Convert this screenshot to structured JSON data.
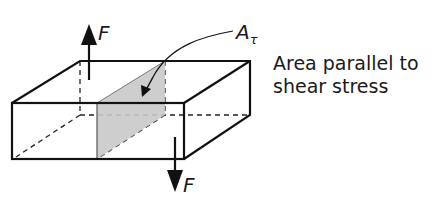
{
  "diagram": {
    "labels": {
      "force_top": "F",
      "force_bottom": "F",
      "area_symbol": "A",
      "area_subscript": "τ",
      "caption_line1": "Area parallel to",
      "caption_line2": "shear stress"
    },
    "colors": {
      "stroke": "#111111",
      "shaded_plane": "#c9c9c9",
      "background": "#ffffff"
    }
  }
}
